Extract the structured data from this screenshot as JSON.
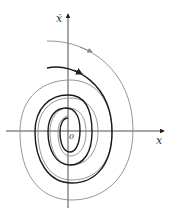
{
  "diagram": {
    "type": "phase-portrait",
    "axes": {
      "x_label": "x",
      "y_label": "ẋ",
      "origin_label": "0"
    },
    "colors": {
      "axis": "#222222",
      "trajectory_dark": "#1a1a1a",
      "trajectory_light": "#8a8a8a"
    },
    "trajectories": [
      {
        "style": "light",
        "description": "outer spiral with arrow"
      },
      {
        "style": "dark",
        "description": "inner spiral with arrow"
      }
    ]
  }
}
